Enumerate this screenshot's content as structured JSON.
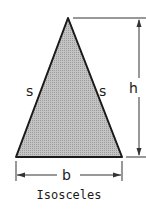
{
  "figure": {
    "shape": "isosceles-triangle",
    "caption": "Isosceles",
    "labels": {
      "left_side": "s",
      "right_side": "s",
      "height": "h",
      "base": "b"
    },
    "colors": {
      "fill": "#b8b8b8",
      "stroke": "#1a1a1a"
    }
  }
}
